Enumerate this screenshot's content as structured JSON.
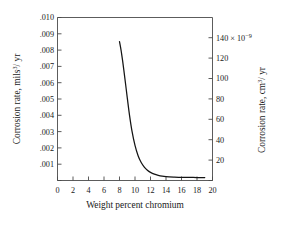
{
  "chart_data": {
    "type": "line",
    "title": "",
    "subtitle": "",
    "xlabel": "Weight percent chromium",
    "ylabel": "Corrosion rate, mils",
    "ylabel_sup": "3",
    "ylabel_tail": "/ yr",
    "y2label": "Corrosion rate, cm",
    "y2label_sup": "3",
    "y2label_tail": "/ yr",
    "xlim": [
      0,
      20
    ],
    "ylim": [
      0,
      0.01
    ],
    "y2lim": [
      0,
      160
    ],
    "y2_exponent_label": "140 × 10",
    "y2_exponent_sup": "−9",
    "grid": false,
    "legend": null,
    "xticks": [
      0,
      2,
      4,
      6,
      8,
      10,
      12,
      14,
      16,
      18,
      20
    ],
    "xticklabels": [
      "0",
      "2",
      "4",
      "6",
      "8",
      "10",
      "12",
      "14",
      "16",
      "18",
      "20"
    ],
    "yticks": [
      0.001,
      0.002,
      0.003,
      0.004,
      0.005,
      0.006,
      0.007,
      0.008,
      0.009,
      0.01
    ],
    "yticklabels": [
      ".001",
      ".002",
      ".003",
      ".004",
      ".005",
      ".006",
      ".007",
      ".008",
      ".009",
      ".010"
    ],
    "y2ticks": [
      20,
      40,
      60,
      80,
      100,
      120,
      140
    ],
    "y2ticklabels": [
      "20",
      "40",
      "60",
      "80",
      "100",
      "120",
      "140 × 10"
    ],
    "series": [
      {
        "name": "Corrosion rate vs chromium content",
        "x": [
          8.0,
          8.2,
          8.4,
          8.6,
          8.8,
          9.0,
          9.3,
          9.6,
          10.0,
          10.4,
          10.8,
          11.2,
          11.6,
          12.0,
          12.5,
          13.0,
          13.5,
          14.0,
          15.0,
          16.0,
          17.0,
          18.0,
          19.0
        ],
        "y": [
          0.00852,
          0.008,
          0.00735,
          0.00662,
          0.00586,
          0.00508,
          0.00398,
          0.00306,
          0.00215,
          0.00152,
          0.0011,
          0.00082,
          0.00063,
          0.0005,
          0.00039,
          0.00032,
          0.00027,
          0.00024,
          0.00021,
          0.00019,
          0.00019,
          0.00018,
          0.00018
        ]
      }
    ]
  }
}
